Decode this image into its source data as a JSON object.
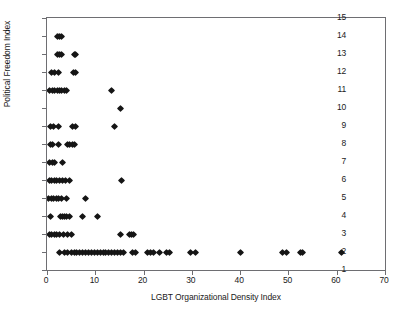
{
  "chart_data": {
    "type": "scatter",
    "title": "",
    "xlabel": "LGBT Organizational Density Index",
    "ylabel": "Political Freedom Index",
    "xlim": [
      0,
      70
    ],
    "ylim": [
      1,
      15
    ],
    "xticks": [
      0,
      10,
      20,
      30,
      40,
      50,
      60,
      70
    ],
    "yticks": [
      1,
      2,
      3,
      4,
      5,
      6,
      7,
      8,
      9,
      10,
      11,
      12,
      13,
      14,
      15
    ],
    "grid": false,
    "legend": null,
    "marker": "diamond",
    "marker_color": "#151515",
    "frame_color": "#6e6e72",
    "background": "#ffffff",
    "points": [
      [
        2.2,
        14
      ],
      [
        2.6,
        14
      ],
      [
        3.0,
        14
      ],
      [
        2.2,
        13
      ],
      [
        2.6,
        13
      ],
      [
        3.0,
        13
      ],
      [
        5.6,
        13
      ],
      [
        6.0,
        13
      ],
      [
        1.0,
        12
      ],
      [
        1.6,
        12
      ],
      [
        2.4,
        12
      ],
      [
        5.4,
        12
      ],
      [
        5.8,
        12
      ],
      [
        0.6,
        11
      ],
      [
        1.1,
        11
      ],
      [
        1.6,
        11
      ],
      [
        2.1,
        11
      ],
      [
        2.6,
        11
      ],
      [
        3.1,
        11
      ],
      [
        3.6,
        11
      ],
      [
        4.1,
        11
      ],
      [
        13.3,
        11
      ],
      [
        15.2,
        10
      ],
      [
        0.8,
        9
      ],
      [
        1.3,
        9
      ],
      [
        2.4,
        9
      ],
      [
        5.2,
        9
      ],
      [
        5.8,
        9
      ],
      [
        14.0,
        9
      ],
      [
        0.7,
        8
      ],
      [
        1.2,
        8
      ],
      [
        2.4,
        8
      ],
      [
        4.2,
        8
      ],
      [
        4.7,
        8
      ],
      [
        5.2,
        8
      ],
      [
        5.7,
        8
      ],
      [
        0.6,
        7
      ],
      [
        1.1,
        7
      ],
      [
        1.6,
        7
      ],
      [
        3.2,
        7
      ],
      [
        0.5,
        6
      ],
      [
        1.0,
        6
      ],
      [
        1.5,
        6
      ],
      [
        2.0,
        6
      ],
      [
        2.6,
        6
      ],
      [
        3.2,
        6
      ],
      [
        3.8,
        6
      ],
      [
        4.6,
        6
      ],
      [
        15.4,
        6
      ],
      [
        0.4,
        5
      ],
      [
        0.9,
        5
      ],
      [
        1.4,
        5
      ],
      [
        1.9,
        5
      ],
      [
        2.4,
        5
      ],
      [
        2.9,
        5
      ],
      [
        4.0,
        5
      ],
      [
        8.0,
        5
      ],
      [
        0.8,
        4
      ],
      [
        2.8,
        4
      ],
      [
        3.2,
        4
      ],
      [
        3.6,
        4
      ],
      [
        4.0,
        4
      ],
      [
        4.6,
        4
      ],
      [
        7.4,
        4
      ],
      [
        10.4,
        4
      ],
      [
        0.5,
        3
      ],
      [
        1.0,
        3
      ],
      [
        1.5,
        3
      ],
      [
        2.0,
        3
      ],
      [
        2.6,
        3
      ],
      [
        3.4,
        3
      ],
      [
        4.2,
        3
      ],
      [
        5.0,
        3
      ],
      [
        15.2,
        3
      ],
      [
        17.0,
        3
      ],
      [
        17.5,
        3
      ],
      [
        18.0,
        3
      ],
      [
        2.6,
        2
      ],
      [
        3.6,
        2
      ],
      [
        4.3,
        2
      ],
      [
        5.0,
        2
      ],
      [
        5.6,
        2
      ],
      [
        6.2,
        2
      ],
      [
        6.8,
        2
      ],
      [
        7.4,
        2
      ],
      [
        8.0,
        2
      ],
      [
        8.6,
        2
      ],
      [
        9.2,
        2
      ],
      [
        9.8,
        2
      ],
      [
        10.4,
        2
      ],
      [
        11.0,
        2
      ],
      [
        11.6,
        2
      ],
      [
        12.2,
        2
      ],
      [
        12.8,
        2
      ],
      [
        13.4,
        2
      ],
      [
        14.0,
        2
      ],
      [
        14.6,
        2
      ],
      [
        15.2,
        2
      ],
      [
        15.8,
        2
      ],
      [
        17.8,
        2
      ],
      [
        18.4,
        2
      ],
      [
        20.8,
        2
      ],
      [
        21.4,
        2
      ],
      [
        22.0,
        2
      ],
      [
        23.4,
        2
      ],
      [
        24.8,
        2
      ],
      [
        25.4,
        2
      ],
      [
        29.8,
        2
      ],
      [
        30.8,
        2
      ],
      [
        40.0,
        2
      ],
      [
        48.8,
        2
      ],
      [
        49.6,
        2
      ],
      [
        52.4,
        2
      ],
      [
        53.0,
        2
      ],
      [
        61.0,
        2
      ]
    ]
  }
}
